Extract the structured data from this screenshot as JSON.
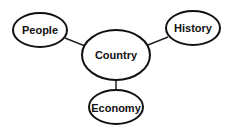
{
  "diagram": {
    "type": "mind-map",
    "center": {
      "label": "Country"
    },
    "nodes": [
      {
        "id": "people",
        "label": "People"
      },
      {
        "id": "history",
        "label": "History"
      },
      {
        "id": "country",
        "label": "Country"
      },
      {
        "id": "economy",
        "label": "Economy"
      }
    ],
    "edges": [
      {
        "from": "country",
        "to": "people"
      },
      {
        "from": "country",
        "to": "history"
      },
      {
        "from": "country",
        "to": "economy"
      }
    ]
  }
}
